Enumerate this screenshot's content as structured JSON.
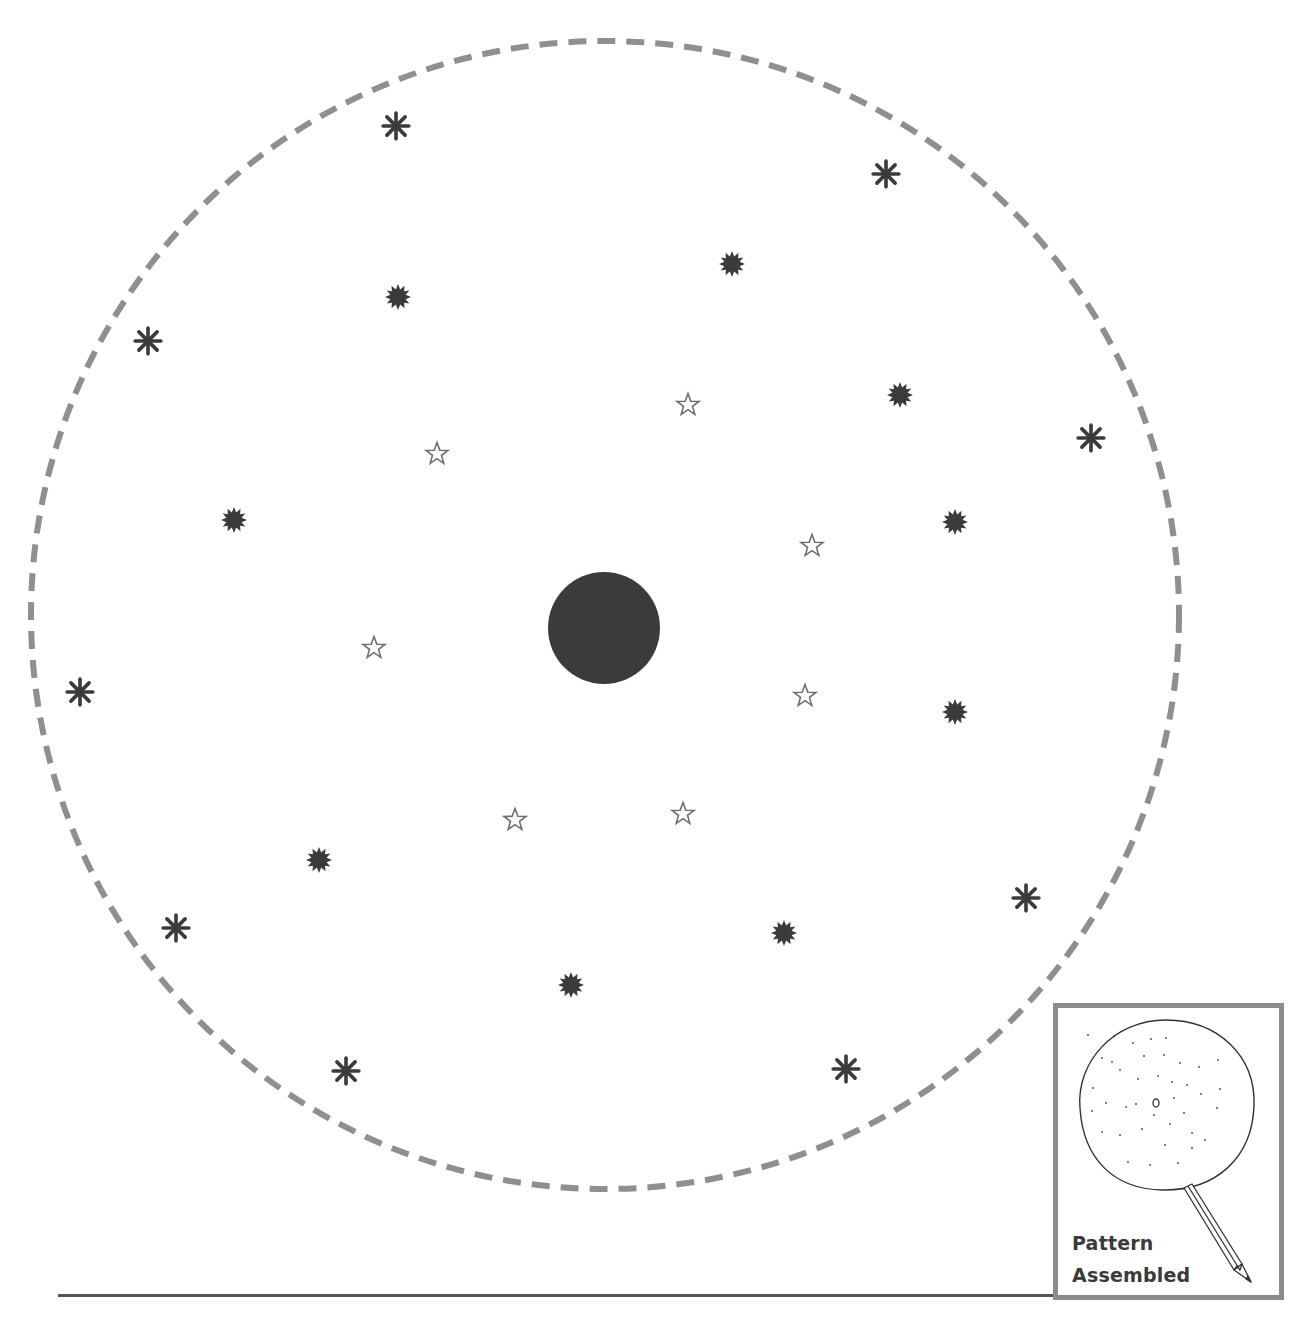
{
  "figure": {
    "colors": {
      "dashed_outline": "#8f8f8f",
      "center_dot": "#3b3b3b",
      "burst": "#3b3b3b",
      "asterisk": "#3b3b3b",
      "star_outline": "#6e6e6e",
      "inset_border": "#8c8c8c",
      "baseline": "#555555"
    },
    "outer_circle": {
      "cx": 605,
      "cy": 615,
      "r": 574,
      "style": "dashed"
    },
    "center_dot": {
      "cx": 604,
      "cy": 628,
      "r": 56
    },
    "markers": {
      "asterisks": [
        {
          "x": 396,
          "y": 126
        },
        {
          "x": 886,
          "y": 174
        },
        {
          "x": 148,
          "y": 341
        },
        {
          "x": 1091,
          "y": 438
        },
        {
          "x": 80,
          "y": 692
        },
        {
          "x": 1026,
          "y": 898
        },
        {
          "x": 176,
          "y": 928
        },
        {
          "x": 346,
          "y": 1071
        },
        {
          "x": 846,
          "y": 1069
        }
      ],
      "bursts": [
        {
          "x": 732,
          "y": 264
        },
        {
          "x": 398,
          "y": 297
        },
        {
          "x": 900,
          "y": 395
        },
        {
          "x": 234,
          "y": 520
        },
        {
          "x": 955,
          "y": 522
        },
        {
          "x": 955,
          "y": 712
        },
        {
          "x": 319,
          "y": 860
        },
        {
          "x": 784,
          "y": 933
        },
        {
          "x": 571,
          "y": 985
        }
      ],
      "stars": [
        {
          "x": 688,
          "y": 405
        },
        {
          "x": 437,
          "y": 454
        },
        {
          "x": 812,
          "y": 546
        },
        {
          "x": 374,
          "y": 648
        },
        {
          "x": 805,
          "y": 696
        },
        {
          "x": 683,
          "y": 814
        },
        {
          "x": 515,
          "y": 820
        }
      ]
    }
  },
  "inset": {
    "label_line1": "Pattern",
    "label_line2": "Assembled",
    "icon": "pencil-and-circle-icon"
  }
}
